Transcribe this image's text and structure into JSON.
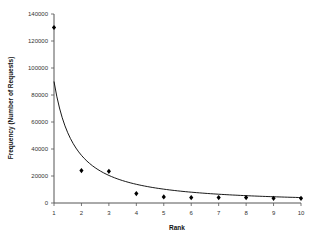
{
  "chart_data": {
    "type": "scatter",
    "title": "",
    "xlabel": "Rank",
    "ylabel": "Frequency (Number of Requests)",
    "x": [
      1,
      2,
      3,
      4,
      5,
      6,
      7,
      8,
      9,
      10
    ],
    "series": [
      {
        "name": "Observed",
        "style": "diamond-markers",
        "values": [
          130000,
          24000,
          23500,
          7000,
          4500,
          4000,
          4000,
          4000,
          3500,
          3500
        ]
      },
      {
        "name": "Fitted curve",
        "style": "line",
        "formula": "y = 90000 * x^-1.35",
        "values": [
          90000,
          35300,
          20300,
          13900,
          10400,
          8100,
          6600,
          5500,
          4800,
          4100
        ]
      }
    ],
    "xlim": [
      1,
      10
    ],
    "ylim": [
      0,
      140000
    ],
    "xticks": [
      "1",
      "2",
      "3",
      "4",
      "5",
      "6",
      "7",
      "8",
      "9",
      "10"
    ],
    "yticks": [
      "0",
      "20000",
      "40000",
      "60000",
      "80000",
      "100000",
      "120000",
      "140000"
    ],
    "grid": false,
    "legend": "none",
    "colors": {
      "markers": "#000000",
      "line": "#000000",
      "axes": "#555555"
    }
  }
}
